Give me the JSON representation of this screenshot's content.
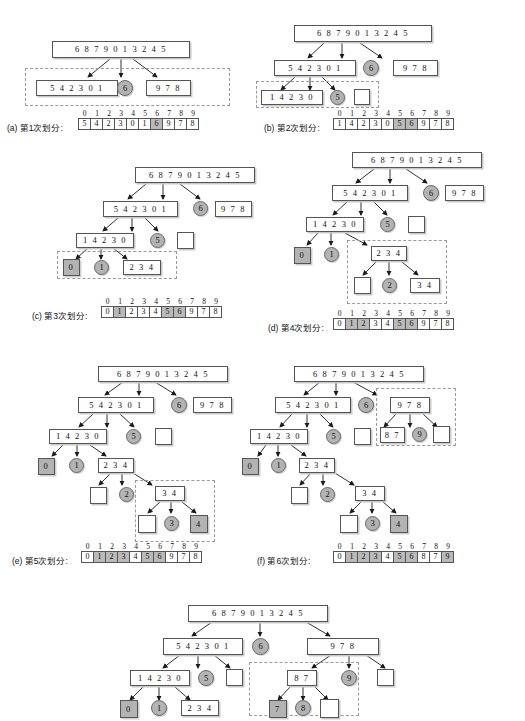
{
  "figure": {
    "root_array": "6 8 7 9 0 1 3 2 4 5",
    "index_header": [
      "0",
      "1",
      "2",
      "3",
      "4",
      "5",
      "6",
      "7",
      "8",
      "9"
    ]
  },
  "panels": [
    {
      "id": "a",
      "caption": "(a) 第1次划分:",
      "nodes": {
        "root": "6 8 7 9 0 1 3 2 4 5",
        "left": "5 4 2 3 0 1",
        "pivot": "6",
        "right": "9 7 8"
      },
      "result": {
        "values": [
          "5",
          "4",
          "2",
          "3",
          "0",
          "1",
          "6",
          "9",
          "7",
          "8"
        ],
        "highlight": [
          6
        ]
      }
    },
    {
      "id": "b",
      "caption": "(b) 第2次划分:",
      "nodes": {
        "root": "6 8 7 9 0 1 3 2 4 5",
        "l1": "5 4 2 3 0 1",
        "p1": "6",
        "r1": "9 7 8",
        "l2": "1 4 2 3 0",
        "p2": "5",
        "r2": ""
      },
      "result": {
        "values": [
          "1",
          "4",
          "2",
          "3",
          "0",
          "5",
          "6",
          "9",
          "7",
          "8"
        ],
        "highlight": [
          5,
          6
        ]
      }
    },
    {
      "id": "c",
      "caption": "(c) 第3次划分:",
      "nodes": {
        "root": "6 8 7 9 0 1 3 2 4 5",
        "l1": "5 4 2 3 0 1",
        "p1": "6",
        "r1": "9 7 8",
        "l2": "1 4 2 3 0",
        "p2": "5",
        "r2": "",
        "l3": "0",
        "p3": "1",
        "r3": "2 3 4"
      },
      "result": {
        "values": [
          "0",
          "1",
          "2",
          "3",
          "4",
          "5",
          "6",
          "9",
          "7",
          "8"
        ],
        "highlight": [
          1,
          5,
          6
        ]
      }
    },
    {
      "id": "d",
      "caption": "(d) 第4次划分:",
      "nodes": {
        "root": "6 8 7 9 0 1 3 2 4 5",
        "l1": "5 4 2 3 0 1",
        "p1": "6",
        "r1": "9 7 8",
        "l2": "1 4 2 3 0",
        "p2": "5",
        "r2": "",
        "l3": "0",
        "p3": "1",
        "r3": "2 3 4",
        "l4": "",
        "p4": "2",
        "r4": "3 4"
      },
      "result": {
        "values": [
          "0",
          "1",
          "2",
          "3",
          "4",
          "5",
          "6",
          "9",
          "7",
          "8"
        ],
        "highlight": [
          1,
          2,
          5,
          6
        ]
      }
    },
    {
      "id": "e",
      "caption": "(e) 第5次划分:",
      "nodes": {
        "root": "6 8 7 9 0 1 3 2 4 5",
        "l1": "5 4 2 3 0 1",
        "p1": "6",
        "r1": "9 7 8",
        "l2": "1 4 2 3 0",
        "p2": "5",
        "r2": "",
        "l3": "0",
        "p3": "1",
        "r3": "2 3 4",
        "l4": "",
        "p4": "2",
        "r4": "3 4",
        "l5": "",
        "p5": "3",
        "r5": "4"
      },
      "result": {
        "values": [
          "0",
          "1",
          "2",
          "3",
          "4",
          "5",
          "6",
          "9",
          "7",
          "8"
        ],
        "highlight": [
          1,
          2,
          3,
          5,
          6
        ]
      }
    },
    {
      "id": "f",
      "caption": "(f) 第6次划分:",
      "nodes": {
        "root": "6 8 7 9 0 1 3 2 4 5",
        "l1": "5 4 2 3 0 1",
        "p1": "6",
        "r1": "9 7 8",
        "l2": "1 4 2 3 0",
        "p2": "5",
        "r2": "",
        "l3": "0",
        "p3": "1",
        "r3": "2 3 4",
        "l4": "",
        "p4": "2",
        "r4": "3 4",
        "l5": "",
        "p5": "3",
        "r5": "4",
        "rl": "8 7",
        "rp": "9",
        "rr": ""
      },
      "result": {
        "values": [
          "0",
          "1",
          "2",
          "3",
          "4",
          "5",
          "6",
          "8",
          "7",
          "9"
        ],
        "highlight": [
          1,
          2,
          3,
          5,
          6,
          9
        ]
      }
    },
    {
      "id": "g",
      "caption": "",
      "nodes": {
        "root": "6 8 7 9 0 1 3 2 4 5",
        "l1": "5 4 2 3 0 1",
        "p1": "6",
        "r1": "9 7 8",
        "l2": "1 4 2 3 0",
        "p2": "5",
        "r2": "",
        "l3": "0",
        "p3": "1",
        "r3": "2 3 4",
        "rl": "8 7",
        "rp": "9",
        "rr": "",
        "rll": "7",
        "rlp": "8",
        "rlr": ""
      }
    }
  ]
}
